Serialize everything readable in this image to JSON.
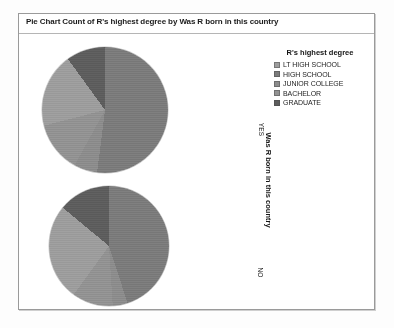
{
  "chart_data": {
    "type": "pie",
    "title": "Pie Chart Count of R's highest degree by Was R born in this country",
    "legend_title": "R's highest degree",
    "legend_position": "right",
    "xlabel": "",
    "ylabel": "Was R born in this country",
    "categories": [
      "LT HIGH SCHOOL",
      "HIGH SCHOOL",
      "JUNIOR COLLEGE",
      "BACHELOR",
      "GRADUATE"
    ],
    "colors": [
      "#9d9d9d",
      "#7b7b7b",
      "#8c8c8c",
      "#929292",
      "#5d5d5d"
    ],
    "panel_variable": "Was R born in this country",
    "panels": [
      {
        "label": "YES",
        "values": [
          19,
          52,
          6,
          13,
          10
        ],
        "slices": [
          {
            "category": "HIGH SCHOOL",
            "percent": 52,
            "color": "#7b7b7b"
          },
          {
            "category": "JUNIOR COLLEGE",
            "percent": 6,
            "color": "#8c8c8c"
          },
          {
            "category": "BACHELOR",
            "percent": 13,
            "color": "#929292"
          },
          {
            "category": "LT HIGH SCHOOL",
            "percent": 19,
            "color": "#9d9d9d"
          },
          {
            "category": "GRADUATE",
            "percent": 10,
            "color": "#5d5d5d"
          }
        ]
      },
      {
        "label": "NO",
        "values": [
          26,
          45,
          4,
          11,
          14
        ],
        "slices": [
          {
            "category": "HIGH SCHOOL",
            "percent": 45,
            "color": "#7b7b7b"
          },
          {
            "category": "JUNIOR COLLEGE",
            "percent": 4,
            "color": "#8c8c8c"
          },
          {
            "category": "BACHELOR",
            "percent": 11,
            "color": "#929292"
          },
          {
            "category": "LT HIGH SCHOOL",
            "percent": 26,
            "color": "#9d9d9d"
          },
          {
            "category": "GRADUATE",
            "percent": 14,
            "color": "#5d5d5d"
          }
        ]
      }
    ]
  },
  "chart": {
    "title": "Pie Chart Count of R's highest degree by Was R born in this country",
    "axis_title": "Was R born in this country",
    "tick_yes": "YES",
    "tick_no": "NO"
  },
  "legend": {
    "title": "R's highest degree",
    "items": [
      {
        "label": "LT HIGH SCHOOL",
        "color": "#9d9d9d"
      },
      {
        "label": "HIGH SCHOOL",
        "color": "#7b7b7b"
      },
      {
        "label": "JUNIOR COLLEGE",
        "color": "#8c8c8c"
      },
      {
        "label": "BACHELOR",
        "color": "#929292"
      },
      {
        "label": "GRADUATE",
        "color": "#5d5d5d"
      }
    ]
  }
}
